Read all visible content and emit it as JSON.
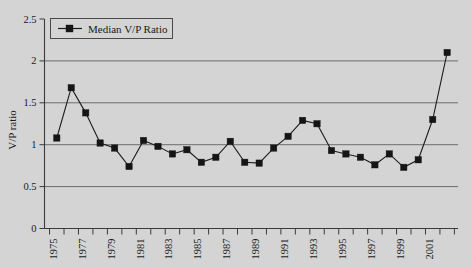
{
  "chart_data": {
    "type": "line",
    "title": "",
    "xlabel": "",
    "ylabel": "V/P ratio",
    "ylim": [
      0,
      2.5
    ],
    "yticks": [
      "0",
      "0.5",
      "1",
      "1.5",
      "2",
      "2.5"
    ],
    "ytick_values": [
      0,
      0.5,
      1,
      1.5,
      2,
      2.5
    ],
    "grid": "horizontal",
    "gridlines": [
      0.5,
      1,
      1.5,
      2
    ],
    "legend": {
      "position": "top-left",
      "entries": [
        {
          "name": "Median V/P Ratio",
          "marker": "square",
          "color": "#151515"
        }
      ]
    },
    "x": [
      1975,
      1976,
      1977,
      1978,
      1979,
      1980,
      1981,
      1982,
      1983,
      1984,
      1985,
      1986,
      1987,
      1988,
      1989,
      1990,
      1991,
      1992,
      1993,
      1994,
      1995,
      1996,
      1997,
      1998,
      1999,
      2000,
      2001,
      2002
    ],
    "xtick_labels": [
      "1975",
      "",
      "1977",
      "",
      "1979",
      "",
      "1981",
      "",
      "1983",
      "",
      "1985",
      "",
      "1987",
      "",
      "1989",
      "",
      "1991",
      "",
      "1993",
      "",
      "1995",
      "",
      "1997",
      "",
      "1999",
      "",
      "2001",
      ""
    ],
    "xtick_labels_shown": [
      "1975",
      "1977",
      "1979",
      "1981",
      "1983",
      "1985",
      "1987",
      "1989",
      "1991",
      "1993",
      "1995",
      "1997",
      "1999",
      "2001"
    ],
    "series": [
      {
        "name": "Median V/P Ratio",
        "values": [
          1.08,
          1.68,
          1.38,
          1.02,
          0.96,
          0.74,
          1.05,
          0.98,
          0.89,
          0.94,
          0.79,
          0.85,
          1.04,
          0.79,
          0.78,
          0.96,
          1.1,
          1.29,
          1.25,
          0.93,
          0.89,
          0.85,
          0.76,
          0.89,
          0.73,
          0.82,
          1.3,
          2.1
        ]
      }
    ]
  },
  "colors": {
    "background": "#d4d4d4",
    "axis": "#3a3a3a",
    "grid": "#6d6d6d",
    "series": "#151515"
  }
}
